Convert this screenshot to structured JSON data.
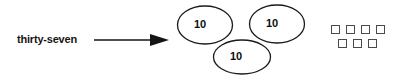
{
  "canvas": {
    "width": 411,
    "height": 79,
    "background": "#ffffff"
  },
  "worksheet": {
    "type": "place-value-representation",
    "number_word": "thirty-seven",
    "number_value": 37,
    "arrow_symbol": "→",
    "tens": {
      "label": "10",
      "count": 3,
      "items": [
        {
          "label": "10",
          "position": "top-left"
        },
        {
          "label": "10",
          "position": "top-right"
        },
        {
          "label": "10",
          "position": "bottom-center"
        }
      ]
    },
    "ones": {
      "count": 7,
      "rows": [
        {
          "count": 4
        },
        {
          "count": 3
        }
      ]
    },
    "colors": {
      "ink": "#161616",
      "outline": "#1a1a1a",
      "square_outline": "#4a4a4a",
      "background": "#ffffff"
    }
  }
}
